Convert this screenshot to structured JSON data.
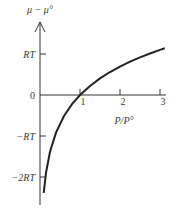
{
  "chart_data": {
    "type": "line",
    "title": "",
    "xlabel": "P/P°",
    "ylabel": "μ − μ°",
    "function": "μ − μ° = RT ln(P/P°)",
    "x_ticks": [
      {
        "value": 1,
        "label": "1"
      },
      {
        "value": 2,
        "label": "2"
      },
      {
        "value": 3,
        "label": "3"
      }
    ],
    "y_ticks": [
      {
        "value": 1,
        "label": "RT"
      },
      {
        "value": 0,
        "label": "0"
      },
      {
        "value": -1,
        "label": "−RT"
      },
      {
        "value": -2,
        "label": "−2RT"
      }
    ],
    "xlim": [
      0,
      3.15
    ],
    "ylim": [
      -2.7,
      1.7
    ],
    "grid": false,
    "legend": null,
    "series": [
      {
        "name": "μ − μ° (in units of RT)",
        "x": [
          0.092,
          0.15,
          0.25,
          0.4,
          0.6,
          0.8,
          1.0,
          1.25,
          1.5,
          1.75,
          2.0,
          2.25,
          2.5,
          2.75,
          3.0,
          3.12
        ],
        "y": [
          -2.386,
          -1.897,
          -1.386,
          -0.916,
          -0.511,
          -0.223,
          0.0,
          0.223,
          0.405,
          0.56,
          0.693,
          0.811,
          0.916,
          1.012,
          1.099,
          1.138
        ]
      }
    ]
  }
}
